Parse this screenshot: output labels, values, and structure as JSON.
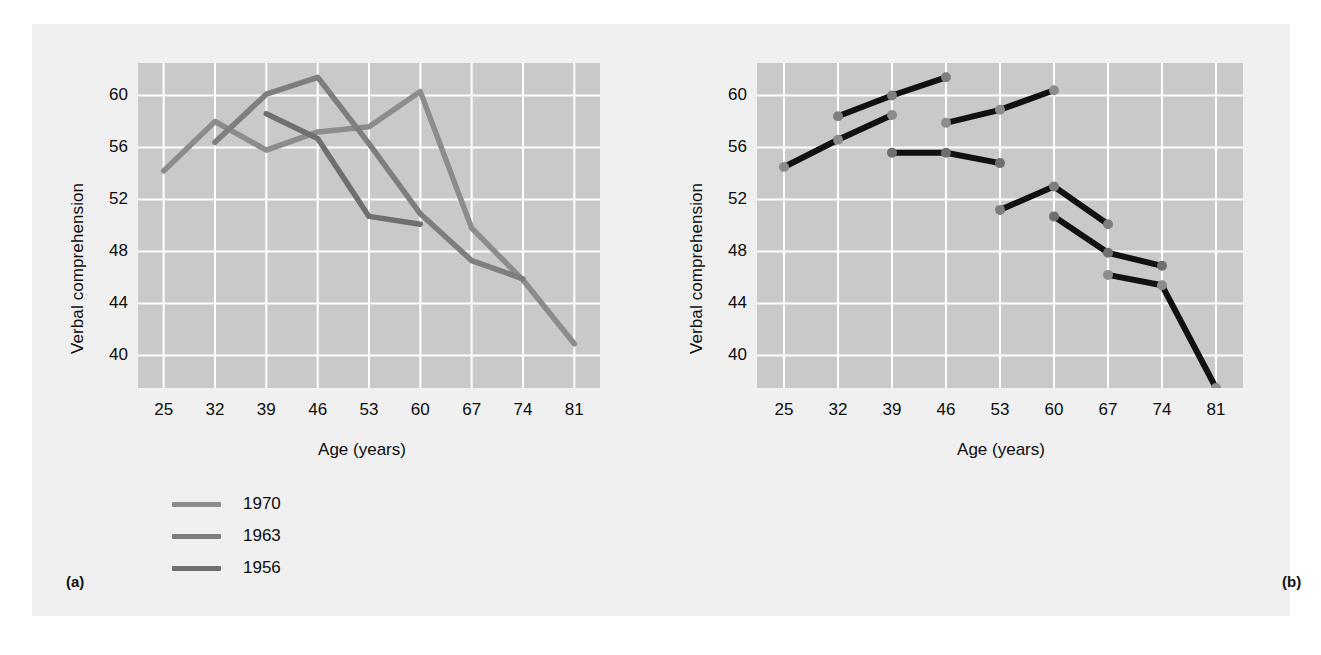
{
  "figure": {
    "background": "#f0f0f0",
    "plot_background": "#c9c9c9",
    "gridline_color": "#ffffff"
  },
  "panels": [
    {
      "tag": "(a)",
      "name": "cross-sectional-panel",
      "ylabel": "Verbal comprehension",
      "xlabel": "Age (years)"
    },
    {
      "tag": "(b)",
      "name": "cohort-sequential-panel",
      "ylabel": "Verbal comprehension",
      "xlabel": "Age (years)"
    }
  ],
  "axis": {
    "yticks": [
      40,
      44,
      48,
      52,
      56,
      60
    ],
    "xticks": [
      25,
      32,
      39,
      46,
      53,
      60,
      67,
      74,
      81
    ],
    "ylim": [
      37.5,
      62.5
    ],
    "xlim": [
      21.5,
      84.5
    ]
  },
  "legend": {
    "entries": [
      {
        "label": "1970",
        "color": "#8c8c8c",
        "marker": "line"
      },
      {
        "label": "1963",
        "color": "#7e7e7e",
        "marker": "line"
      },
      {
        "label": "1956",
        "color": "#6f6f6f",
        "marker": "line"
      }
    ],
    "entries_b": [
      {
        "label": "1970",
        "color": "#8c8c8c",
        "marker": "dot"
      },
      {
        "label": "1963",
        "color": "#7e7e7e",
        "marker": "dot"
      },
      {
        "label": "1956",
        "color": "#6f6f6f",
        "marker": "dot"
      }
    ]
  },
  "chart_data": [
    {
      "type": "line",
      "name": "panel-a-cross-sectional",
      "title": "(a)",
      "xlabel": "Age (years)",
      "ylabel": "Verbal comprehension",
      "xticks": [
        25,
        32,
        39,
        46,
        53,
        60,
        67,
        74,
        81
      ],
      "yticks": [
        40,
        44,
        48,
        52,
        56,
        60
      ],
      "ylim": [
        37.5,
        62.5
      ],
      "grid": true,
      "legend_position": "below-left",
      "series": [
        {
          "name": "1970",
          "color": "#8c8c8c",
          "x": [
            25,
            32,
            39,
            46,
            53,
            60,
            67,
            74,
            81
          ],
          "values": [
            54.2,
            58.0,
            55.8,
            57.2,
            57.6,
            60.3,
            49.8,
            45.8,
            40.9
          ]
        },
        {
          "name": "1963",
          "color": "#7e7e7e",
          "x": [
            32,
            39,
            46,
            53,
            60,
            67,
            74
          ],
          "values": [
            56.4,
            60.1,
            61.4,
            56.3,
            50.9,
            47.3,
            45.9
          ]
        },
        {
          "name": "1956",
          "color": "#6f6f6f",
          "x": [
            39,
            46,
            53,
            60
          ],
          "values": [
            58.6,
            56.7,
            50.7,
            50.1
          ]
        }
      ]
    },
    {
      "type": "line",
      "name": "panel-b-cohort-sequential",
      "title": "(b)",
      "xlabel": "Age (years)",
      "ylabel": "Verbal comprehension",
      "xticks": [
        25,
        32,
        39,
        46,
        53,
        60,
        67,
        74,
        81
      ],
      "yticks": [
        40,
        44,
        48,
        52,
        56,
        60
      ],
      "ylim": [
        37.5,
        62.5
      ],
      "grid": true,
      "legend_position": "below-left",
      "segments": [
        {
          "cohort": "1970",
          "color": "#8c8c8c",
          "x": [
            25,
            32,
            39
          ],
          "values": [
            54.5,
            56.6,
            58.5
          ]
        },
        {
          "cohort": "1963",
          "color": "#7e7e7e",
          "x": [
            32,
            39,
            46
          ],
          "values": [
            58.4,
            60.0,
            61.4
          ]
        },
        {
          "cohort": "1956",
          "color": "#6f6f6f",
          "x": [
            39,
            46,
            53
          ],
          "values": [
            55.6,
            55.6,
            54.8
          ]
        },
        {
          "cohort": "1970",
          "color": "#8c8c8c",
          "x": [
            46,
            53,
            60
          ],
          "values": [
            57.9,
            58.9,
            60.4
          ]
        },
        {
          "cohort": "1963",
          "color": "#7e7e7e",
          "x": [
            53,
            60,
            67
          ],
          "values": [
            51.2,
            53.0,
            50.1
          ]
        },
        {
          "cohort": "1956",
          "color": "#6f6f6f",
          "x": [
            60,
            67,
            74
          ],
          "values": [
            50.7,
            47.9,
            46.9
          ]
        },
        {
          "cohort": "1970",
          "color": "#8c8c8c",
          "x": [
            67,
            74,
            81
          ],
          "values": [
            46.2,
            45.4,
            37.5
          ]
        }
      ]
    }
  ]
}
